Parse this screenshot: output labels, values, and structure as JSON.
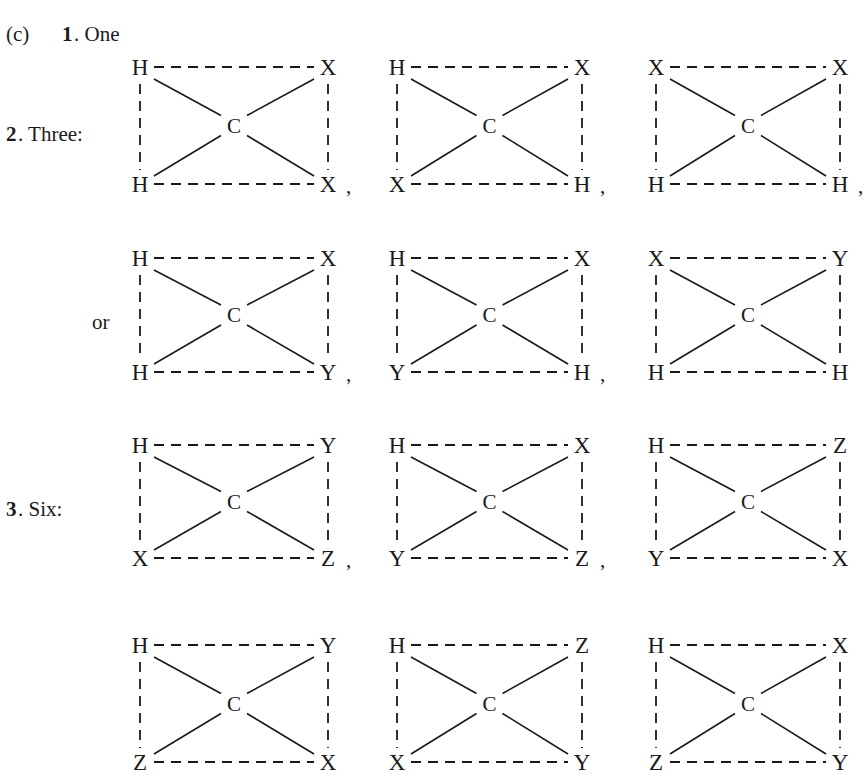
{
  "header": {
    "part_label": "(c)",
    "item1_number": "1",
    "item1_text": ". One"
  },
  "sections": [
    {
      "number": "2",
      "label": ". Three:",
      "alt_label": "or",
      "rows": [
        {
          "diagrams": [
            {
              "tl": "H",
              "tr": "X",
              "bl": "H",
              "br": "X",
              "center": "C",
              "trailing": ","
            },
            {
              "tl": "H",
              "tr": "X",
              "bl": "X",
              "br": "H",
              "center": "C",
              "trailing": ","
            },
            {
              "tl": "X",
              "tr": "X",
              "bl": "H",
              "br": "H",
              "center": "C",
              "trailing": ","
            }
          ]
        },
        {
          "diagrams": [
            {
              "tl": "H",
              "tr": "X",
              "bl": "H",
              "br": "Y",
              "center": "C",
              "trailing": ","
            },
            {
              "tl": "H",
              "tr": "X",
              "bl": "Y",
              "br": "H",
              "center": "C",
              "trailing": ","
            },
            {
              "tl": "X",
              "tr": "Y",
              "bl": "H",
              "br": "H",
              "center": "C",
              "trailing": ""
            }
          ]
        }
      ]
    },
    {
      "number": "3",
      "label": ". Six:",
      "rows": [
        {
          "diagrams": [
            {
              "tl": "H",
              "tr": "Y",
              "bl": "X",
              "br": "Z",
              "center": "C",
              "trailing": ","
            },
            {
              "tl": "H",
              "tr": "X",
              "bl": "Y",
              "br": "Z",
              "center": "C",
              "trailing": ","
            },
            {
              "tl": "H",
              "tr": "Z",
              "bl": "Y",
              "br": "X",
              "center": "C",
              "trailing": ""
            }
          ]
        },
        {
          "diagrams": [
            {
              "tl": "H",
              "tr": "Y",
              "bl": "Z",
              "br": "X",
              "center": "C",
              "trailing": ""
            },
            {
              "tl": "H",
              "tr": "Z",
              "bl": "X",
              "br": "Y",
              "center": "C",
              "trailing": ""
            },
            {
              "tl": "H",
              "tr": "X",
              "bl": "Z",
              "br": "Y",
              "center": "C",
              "trailing": ""
            }
          ]
        }
      ]
    }
  ]
}
